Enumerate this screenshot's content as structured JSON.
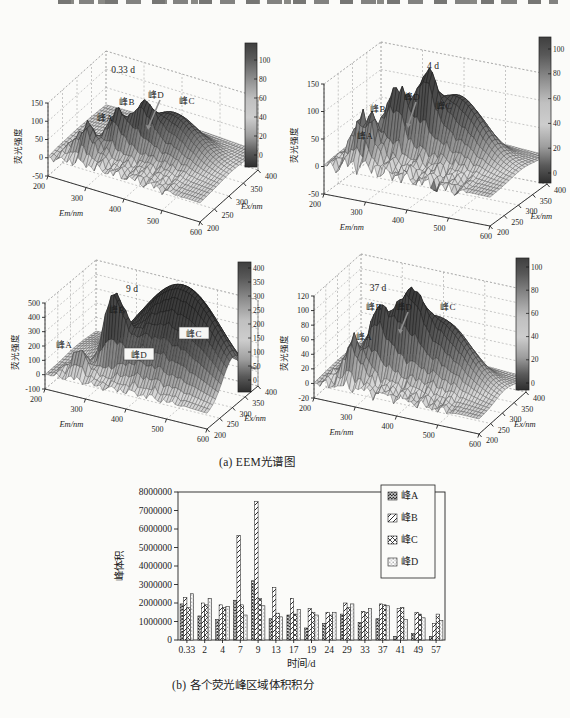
{
  "captions": {
    "a": "(a) EEM光谱图",
    "b": "(b) 各个荧光峰区域体积积分"
  },
  "chart_data": [
    {
      "type": "heatmap",
      "subtype": "3d-eem-surface",
      "title": "0.33 d",
      "xlabel": "Em/nm",
      "x_ticks": [
        "200",
        "300",
        "400",
        "500",
        "600"
      ],
      "xlim": [
        200,
        600
      ],
      "ylabel": "Ex/nm",
      "y_ticks": [
        "200",
        "250",
        "300",
        "350",
        "400"
      ],
      "ylim": [
        200,
        400
      ],
      "zlabel": "荧光强度",
      "z_ticks": [
        "150",
        "100",
        "50",
        "0",
        "-50"
      ],
      "zlim": [
        -50,
        150
      ],
      "colorbar_ticks": [
        "100",
        "80",
        "60",
        "40",
        "20",
        "0"
      ],
      "peaks": [
        "峰A",
        "峰B",
        "峰D",
        "峰C"
      ]
    },
    {
      "type": "heatmap",
      "subtype": "3d-eem-surface",
      "title": "4 d",
      "xlabel": "Em/nm",
      "x_ticks": [
        "200",
        "300",
        "400",
        "500",
        "600"
      ],
      "xlim": [
        200,
        600
      ],
      "ylabel": "Ex/nm",
      "y_ticks": [
        "200",
        "250",
        "300",
        "350",
        "400"
      ],
      "ylim": [
        200,
        400
      ],
      "zlabel": "荧光强度",
      "z_ticks": [
        "150",
        "100",
        "50",
        "0",
        "-50"
      ],
      "zlim": [
        -50,
        150
      ],
      "colorbar_ticks": [
        "100",
        "80",
        "60",
        "40",
        "20",
        "0"
      ],
      "peaks": [
        "峰A",
        "峰B",
        "峰D",
        "峰C"
      ]
    },
    {
      "type": "heatmap",
      "subtype": "3d-eem-surface",
      "title": "9 d",
      "xlabel": "Em/nm",
      "x_ticks": [
        "200",
        "300",
        "400",
        "500",
        "600"
      ],
      "xlim": [
        200,
        600
      ],
      "ylabel": "Ex/nm",
      "y_ticks": [
        "200",
        "250",
        "300",
        "350",
        "400"
      ],
      "ylim": [
        200,
        400
      ],
      "zlabel": "荧光强度",
      "z_ticks": [
        "500",
        "400",
        "300",
        "200",
        "100",
        "0",
        "-100"
      ],
      "zlim": [
        -100,
        500
      ],
      "colorbar_ticks": [
        "400",
        "350",
        "300",
        "250",
        "200",
        "150",
        "100",
        "50",
        "0"
      ],
      "peaks": [
        "峰A",
        "峰B",
        "峰C",
        "峰D"
      ]
    },
    {
      "type": "heatmap",
      "subtype": "3d-eem-surface",
      "title": "37 d",
      "xlabel": "Em/nm",
      "x_ticks": [
        "200",
        "300",
        "400",
        "500",
        "600"
      ],
      "xlim": [
        200,
        600
      ],
      "ylabel": "Ex/nm",
      "y_ticks": [
        "200",
        "250",
        "300",
        "350",
        "400"
      ],
      "ylim": [
        200,
        400
      ],
      "zlabel": "荧光强度",
      "z_ticks": [
        "120",
        "100",
        "80",
        "60",
        "40",
        "20",
        "0",
        "-20"
      ],
      "zlim": [
        -20,
        120
      ],
      "colorbar_ticks": [
        "100",
        "80",
        "60",
        "40",
        "20",
        "0"
      ],
      "peaks": [
        "峰A",
        "峰B",
        "峰D",
        "峰C"
      ]
    },
    {
      "type": "bar",
      "title": "",
      "xlabel": "时间/d",
      "ylabel": "峰体积",
      "ylim": [
        0,
        8000000
      ],
      "y_ticks": [
        "0",
        "1000000",
        "2000000",
        "3000000",
        "4000000",
        "5000000",
        "6000000",
        "7000000",
        "8000000"
      ],
      "categories": [
        "0.33",
        "2",
        "4",
        "7",
        "9",
        "13",
        "17",
        "19",
        "24",
        "29",
        "33",
        "37",
        "41",
        "49",
        "57"
      ],
      "series": [
        {
          "name": "峰A",
          "values": [
            1950000,
            1300000,
            1100000,
            2150000,
            3200000,
            1150000,
            1350000,
            650000,
            900000,
            1400000,
            950000,
            1150000,
            200000,
            350000,
            200000
          ]
        },
        {
          "name": "峰B",
          "values": [
            2300000,
            2000000,
            1900000,
            5650000,
            7500000,
            2850000,
            2250000,
            1700000,
            1500000,
            2000000,
            1550000,
            1950000,
            1700000,
            1500000,
            900000
          ]
        },
        {
          "name": "峰C",
          "values": [
            1750000,
            1900000,
            1750000,
            1900000,
            2250000,
            1450000,
            1400000,
            1500000,
            1350000,
            1750000,
            1500000,
            1900000,
            1750000,
            1400000,
            1400000
          ]
        },
        {
          "name": "峰D",
          "values": [
            2500000,
            2250000,
            1800000,
            1350000,
            1850000,
            1250000,
            1650000,
            1350000,
            1500000,
            1950000,
            1700000,
            1850000,
            1100000,
            1200000,
            1050000
          ]
        }
      ],
      "legend_position": "upper right",
      "grid": false
    }
  ]
}
